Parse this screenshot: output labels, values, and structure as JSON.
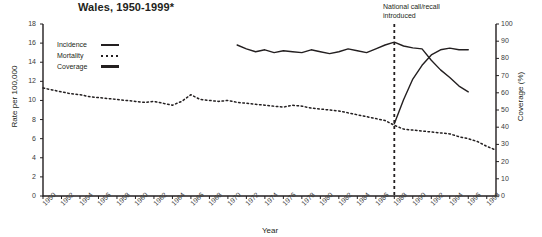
{
  "chart_title": "Wales, 1950-1999*",
  "axis": {
    "left_title": "Rate per 100,000",
    "right_title": "Coverage (%)",
    "x_title": "Year"
  },
  "legend": {
    "items": [
      {
        "label": "Incidence",
        "style": "solid",
        "icon": "line-solid-icon"
      },
      {
        "label": "Mortality",
        "style": "dotted",
        "icon": "line-dotted-icon"
      },
      {
        "label": "Coverage",
        "style": "thick",
        "icon": "line-thick-icon"
      }
    ]
  },
  "annotation": {
    "line1": "National call/recall",
    "line2": "introduced",
    "at_year": 1988
  },
  "chart_data": {
    "type": "line",
    "title": "Wales, 1950-1999*",
    "xlabel": "Year",
    "ylabel": "Rate per 100,000",
    "y2label": "Coverage (%)",
    "xlim": [
      1950,
      1999
    ],
    "ylim": [
      0,
      18
    ],
    "y2lim": [
      0,
      100
    ],
    "ytick_step": 2,
    "y2tick_step": 10,
    "xtick_step": 2,
    "grid": false,
    "legend_position": "upper-left-inside",
    "xticks": [
      1950,
      1952,
      1954,
      1956,
      1958,
      1960,
      1962,
      1964,
      1966,
      1968,
      1970,
      1972,
      1974,
      1976,
      1978,
      1980,
      1982,
      1984,
      1986,
      1988,
      1990,
      1992,
      1994,
      1996,
      1998
    ],
    "yticks": [
      0,
      2,
      4,
      6,
      8,
      10,
      12,
      14,
      16,
      18
    ],
    "y2ticks": [
      0,
      10,
      20,
      30,
      40,
      50,
      60,
      70,
      80,
      90,
      100
    ],
    "annotations": [
      {
        "text": "National call/recall introduced",
        "x": 1988,
        "type": "vertical-dashed-line"
      }
    ],
    "series": [
      {
        "name": "Mortality",
        "axis": "left",
        "style": "dotted",
        "x": [
          1950,
          1951,
          1952,
          1953,
          1954,
          1955,
          1956,
          1957,
          1958,
          1959,
          1960,
          1961,
          1962,
          1963,
          1964,
          1965,
          1966,
          1967,
          1968,
          1969,
          1970,
          1971,
          1972,
          1973,
          1974,
          1975,
          1976,
          1977,
          1978,
          1979,
          1980,
          1981,
          1982,
          1983,
          1984,
          1985,
          1986,
          1987,
          1988,
          1989,
          1990,
          1991,
          1992,
          1993,
          1994,
          1995,
          1996,
          1997,
          1998,
          1999
        ],
        "values": [
          11.3,
          11.1,
          10.9,
          10.7,
          10.6,
          10.4,
          10.3,
          10.2,
          10.1,
          10.0,
          9.9,
          9.8,
          9.9,
          9.7,
          9.5,
          9.9,
          10.6,
          10.1,
          10.0,
          9.9,
          10.0,
          9.8,
          9.7,
          9.6,
          9.5,
          9.4,
          9.3,
          9.5,
          9.4,
          9.2,
          9.1,
          9.0,
          8.9,
          8.7,
          8.5,
          8.3,
          8.1,
          7.9,
          7.4,
          7.0,
          6.9,
          6.8,
          6.7,
          6.6,
          6.5,
          6.2,
          6.0,
          5.7,
          5.2,
          4.8
        ]
      },
      {
        "name": "Incidence",
        "axis": "left",
        "style": "solid",
        "x": [
          1971,
          1972,
          1973,
          1974,
          1975,
          1976,
          1977,
          1978,
          1979,
          1980,
          1981,
          1982,
          1983,
          1984,
          1985,
          1986,
          1987,
          1988,
          1989,
          1990,
          1991,
          1992,
          1993,
          1994,
          1995,
          1996
        ],
        "values": [
          15.8,
          15.4,
          15.1,
          15.3,
          15.0,
          15.2,
          15.1,
          15.0,
          15.3,
          15.1,
          14.9,
          15.1,
          15.4,
          15.2,
          15.0,
          15.4,
          15.8,
          16.1,
          15.7,
          15.5,
          15.4,
          14.2,
          13.2,
          12.4,
          11.5,
          10.9
        ]
      },
      {
        "name": "Coverage",
        "axis": "right",
        "style": "solid",
        "x": [
          1988,
          1989,
          1990,
          1991,
          1992,
          1993,
          1994,
          1995,
          1996
        ],
        "values": [
          42,
          56,
          68,
          76,
          82,
          85,
          86,
          85,
          85
        ]
      }
    ]
  }
}
